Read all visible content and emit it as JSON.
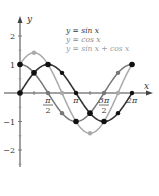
{
  "chart_data": {
    "type": "line",
    "title": "",
    "xlabel": "x",
    "ylabel": "y",
    "xlim": [
      0,
      6.5
    ],
    "ylim": [
      -2.5,
      2.5
    ],
    "grid": false,
    "legend_position": "top-right",
    "x_ticks": [
      {
        "value": 1.5708,
        "label_num": "π",
        "label_den": "2"
      },
      {
        "value": 3.1416,
        "label": "π"
      },
      {
        "value": 4.7124,
        "label_num": "3π",
        "label_den": "2"
      },
      {
        "value": 6.2832,
        "label": "2π"
      }
    ],
    "y_ticks": [
      {
        "value": 2,
        "label": "2"
      },
      {
        "value": 1,
        "label": "1"
      },
      {
        "value": -1,
        "label": "−1"
      },
      {
        "value": -2,
        "label": "−2"
      }
    ],
    "series": [
      {
        "name": "y = sin x",
        "color": "#333333",
        "marker_color": "#111111",
        "x": [
          0,
          0.7854,
          1.5708,
          2.3562,
          3.1416,
          3.927,
          4.7124,
          5.4978,
          6.2832
        ],
        "values": [
          0,
          0.707,
          1,
          0.707,
          0,
          -0.707,
          -1,
          -0.707,
          0
        ]
      },
      {
        "name": "y = cos x",
        "color": "#777777",
        "marker_color": "#777777",
        "x": [
          0,
          0.7854,
          1.5708,
          2.3562,
          3.1416,
          3.927,
          4.7124,
          5.4978,
          6.2832
        ],
        "values": [
          1,
          0.707,
          0,
          -0.707,
          -1,
          -0.707,
          0,
          0.707,
          1
        ]
      },
      {
        "name": "y = sin x + cos x",
        "color": "#aaaaaa",
        "marker_color": "#aaaaaa",
        "x": [
          0,
          0.7854,
          1.5708,
          2.3562,
          3.1416,
          3.927,
          4.7124,
          5.4978,
          6.2832
        ],
        "values": [
          1,
          1.414,
          1,
          0,
          -1,
          -1.414,
          -1,
          0,
          1
        ]
      }
    ],
    "highlighted_points": [
      {
        "x": 0,
        "y": 0
      },
      {
        "x": 0,
        "y": 1
      },
      {
        "x": 0.7854,
        "y": 0.707
      },
      {
        "x": 1.5708,
        "y": 1
      },
      {
        "x": 3.1416,
        "y": -1
      },
      {
        "x": 3.927,
        "y": -0.707
      },
      {
        "x": 4.7124,
        "y": -1
      },
      {
        "x": 6.2832,
        "y": 1
      }
    ]
  },
  "legend": {
    "items": [
      {
        "label": "y = sin x",
        "color": "#333333"
      },
      {
        "label": "y = cos x",
        "color": "#888888"
      },
      {
        "label": "y = sin x + cos x",
        "color": "#999999"
      }
    ]
  },
  "axes": {
    "x_label": "x",
    "y_label": "y"
  }
}
